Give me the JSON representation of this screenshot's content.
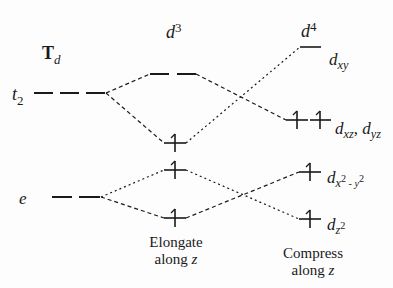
{
  "diagram": {
    "columns": {
      "td": {
        "title_main": "T",
        "title_sub": "d"
      },
      "d3": {
        "title_main": "d",
        "title_sup": "3",
        "caption_line1": "Elongate",
        "caption_line2_text": "along ",
        "caption_line2_var": "z"
      },
      "d4": {
        "title_main": "d",
        "title_sup": "4",
        "caption_line1": "Compress",
        "caption_line2_text": "along ",
        "caption_line2_var": "z"
      }
    },
    "td_levels": [
      {
        "label_main": "t",
        "label_sub": "2",
        "y": 93,
        "x1": 34,
        "x2": 105,
        "degeneracy": 3
      },
      {
        "label_main": "e",
        "label_sub": "",
        "y": 197,
        "x1": 52,
        "x2": 100,
        "degeneracy": 2
      }
    ],
    "d3_levels": [
      {
        "y": 74,
        "x1": 150,
        "x2": 196,
        "degeneracy": 2,
        "electrons": 0
      },
      {
        "y": 143,
        "cx": 175,
        "degeneracy": 1,
        "electrons": 1
      },
      {
        "y": 170,
        "cx": 175,
        "degeneracy": 1,
        "electrons": 1
      },
      {
        "y": 218,
        "cx": 175,
        "degeneracy": 1,
        "electrons": 1
      }
    ],
    "d4_levels": [
      {
        "orbital_main": "d",
        "orbital_sub": "xy",
        "y": 47,
        "x1": 300,
        "x2": 321,
        "degeneracy": 1,
        "electrons": 0
      },
      {
        "orbital_main": "d",
        "orbital_sub": "xz",
        "orbital_sep": ", ",
        "orbital_main2": "d",
        "orbital_sub2": "yz",
        "y": 120,
        "cx": [
          297,
          320
        ],
        "degeneracy": 2,
        "electrons": 2
      },
      {
        "orbital_main": "d",
        "orbital_sub": "x",
        "orbital_sup": "2",
        "orbital_mid": " - y",
        "orbital_sup2": "2",
        "y": 172,
        "cx": 310,
        "degeneracy": 1,
        "electrons": 1
      },
      {
        "orbital_main": "d",
        "orbital_sub": "z",
        "orbital_sup": "2",
        "y": 219,
        "cx": 310,
        "degeneracy": 1,
        "electrons": 1
      }
    ],
    "colors": {
      "ink": "#1a1a1a",
      "background": "#fdfdfd"
    }
  }
}
